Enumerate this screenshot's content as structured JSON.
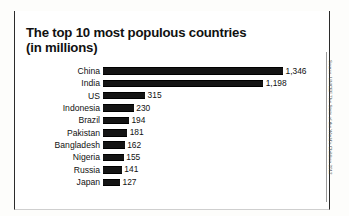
{
  "figure": {
    "title_line1": "The top 10 most populous countries",
    "title_line2": "(in millions)",
    "source": "Source: UNICEF The State of the World's Children 2012"
  },
  "chart_data": {
    "type": "bar",
    "orientation": "horizontal",
    "title": "The top 10 most populous countries (in millions)",
    "xlabel": "",
    "ylabel": "",
    "unit": "millions",
    "grid": false,
    "legend": "none",
    "xlim": [
      0,
      1346
    ],
    "categories": [
      "China",
      "India",
      "US",
      "Indonesia",
      "Brazil",
      "Pakistan",
      "Bangladesh",
      "Nigeria",
      "Russia",
      "Japan"
    ],
    "values": [
      1346,
      1198,
      315,
      230,
      194,
      181,
      162,
      155,
      141,
      127
    ],
    "value_labels": [
      "1,346",
      "1,198",
      "315",
      "230",
      "194",
      "181",
      "162",
      "155",
      "141",
      "127"
    ],
    "source": "Source: UNICEF The State of the World's Children 2012",
    "colors": {
      "bar": "#141414",
      "text": "#111111",
      "background": "#ffffff",
      "rule": "#0d0d0d"
    }
  }
}
